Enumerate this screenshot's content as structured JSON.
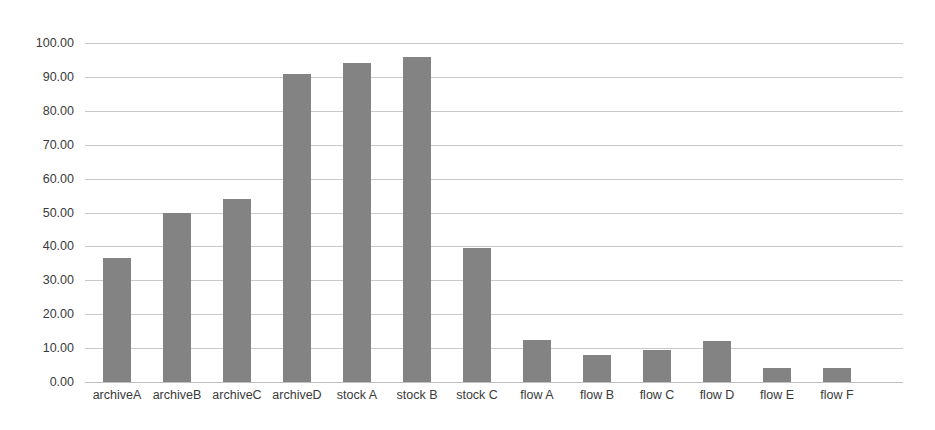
{
  "chart_data": {
    "type": "bar",
    "title": "",
    "xlabel": "",
    "ylabel": "",
    "ylim": [
      0,
      100
    ],
    "ytick_labels": [
      "0.00",
      "10.00",
      "20.00",
      "30.00",
      "40.00",
      "50.00",
      "60.00",
      "70.00",
      "80.00",
      "90.00",
      "100.00"
    ],
    "ytick_values": [
      0,
      10,
      20,
      30,
      40,
      50,
      60,
      70,
      80,
      90,
      100
    ],
    "grid": true,
    "legend": false,
    "bar_color": "#838383",
    "gridline_color": "#c9c9c9",
    "background_color": "#ffffff",
    "categories": [
      "archiveA",
      "archiveB",
      "archiveC",
      "archiveD",
      "stock A",
      "stock B",
      "stock C",
      "flow A",
      "flow B",
      "flow C",
      "flow D",
      "flow E",
      "flow F"
    ],
    "values": [
      36.5,
      50.0,
      54.0,
      91.0,
      94.0,
      96.0,
      39.5,
      12.5,
      8.0,
      9.5,
      12.0,
      4.0,
      4.0
    ]
  }
}
